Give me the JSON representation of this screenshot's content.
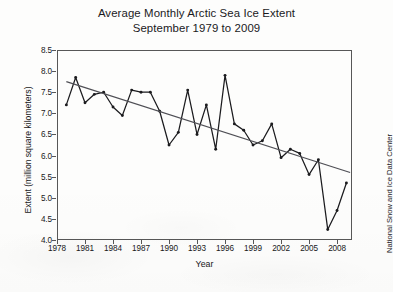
{
  "chart_data": {
    "type": "line",
    "title": "Average Monthly Arctic Sea Ice Extent",
    "subtitle": "September 1979 to 2009",
    "xlabel": "Year",
    "ylabel": "Extent (million square kilometers)",
    "credit": "National Snow and Ice Data Center",
    "xlim": [
      1978,
      2009.6
    ],
    "ylim": [
      4.0,
      8.5
    ],
    "grid": false,
    "legend": "none",
    "xticks": [
      1978,
      1981,
      1984,
      1987,
      1990,
      1993,
      1996,
      1999,
      2002,
      2005,
      2008
    ],
    "xtick_labels": [
      "1978",
      "1981",
      "1984",
      "1987",
      "1990",
      "1993",
      "1996",
      "1999",
      "2002",
      "2005",
      "2008"
    ],
    "yticks": [
      4.0,
      4.5,
      5.0,
      5.5,
      6.0,
      6.5,
      7.0,
      7.5,
      8.0,
      8.5
    ],
    "ytick_labels": [
      "4.0",
      "4.5",
      "5.0",
      "5.5",
      "6.0",
      "6.5",
      "7.0",
      "7.5",
      "8.0",
      "8.5"
    ],
    "x": [
      1979,
      1980,
      1981,
      1982,
      1983,
      1984,
      1985,
      1986,
      1987,
      1988,
      1989,
      1990,
      1991,
      1992,
      1993,
      1994,
      1995,
      1996,
      1997,
      1998,
      1999,
      2000,
      2001,
      2002,
      2003,
      2004,
      2005,
      2006,
      2007,
      2008,
      2009
    ],
    "series": [
      {
        "name": "September sea ice extent",
        "marker": "filled-circle",
        "color": "#1b1b1e",
        "values": [
          7.2,
          7.85,
          7.25,
          7.45,
          7.5,
          7.15,
          6.95,
          7.55,
          7.5,
          7.5,
          7.05,
          6.25,
          6.55,
          7.55,
          6.5,
          7.2,
          6.15,
          7.9,
          6.75,
          6.6,
          6.25,
          6.35,
          6.75,
          5.95,
          6.15,
          6.05,
          5.55,
          5.9,
          4.25,
          4.7,
          5.35
        ]
      },
      {
        "name": "Linear trend",
        "marker": "none",
        "color": "#4f4f55",
        "endpoints": [
          {
            "x": 1979,
            "y": 7.75
          },
          {
            "x": 2009.4,
            "y": 5.6
          }
        ]
      }
    ]
  }
}
